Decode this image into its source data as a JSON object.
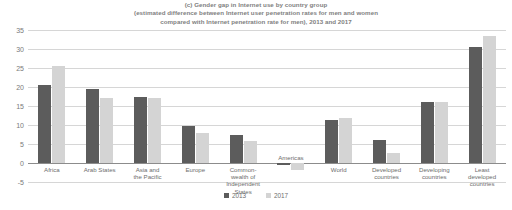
{
  "chart_data": {
    "type": "bar",
    "title": "(c) Gender gap in Internet use by country group (estimated difference between Internet user penetration rates for men and women compared with Internet penetration rate for men), 2013 and 2017",
    "title_lines": [
      "(c) Gender gap in Internet use by country group",
      "(estimated difference between Internet user penetration rates for men and women",
      "compared with Internet penetration rate for men), 2013 and 2017"
    ],
    "categories": [
      "Africa",
      "Arab States",
      "Asia and\nthe Pacific",
      "Europe",
      "Common-\nwealth of\nIndependent\nStates",
      "Americas",
      "World",
      "Developed\ncountries",
      "Developing\ncountries",
      "Least\ndeveloped\ncountries"
    ],
    "series": [
      {
        "name": "2013",
        "color": "#5c5c5c",
        "values": [
          20.5,
          19.4,
          17.4,
          9.7,
          7.5,
          -0.4,
          11.4,
          6.1,
          16.0,
          30.5
        ]
      },
      {
        "name": "2017",
        "color": "#d4d4d4",
        "values": [
          25.5,
          17.2,
          17.0,
          7.9,
          5.7,
          -1.8,
          11.9,
          2.7,
          16.1,
          33.5
        ]
      }
    ],
    "xlabel": "",
    "ylabel": "",
    "ylim": [
      -5,
      35
    ],
    "yticks": [
      35,
      30,
      25,
      20,
      15,
      10,
      5,
      0,
      -5
    ],
    "ytick_labels": [
      "35",
      "30",
      "25",
      "20",
      "15",
      "10",
      "5",
      "0",
      "-5"
    ],
    "grid": true,
    "legend_position": "bottom",
    "legend": [
      "2013",
      "2017"
    ]
  }
}
